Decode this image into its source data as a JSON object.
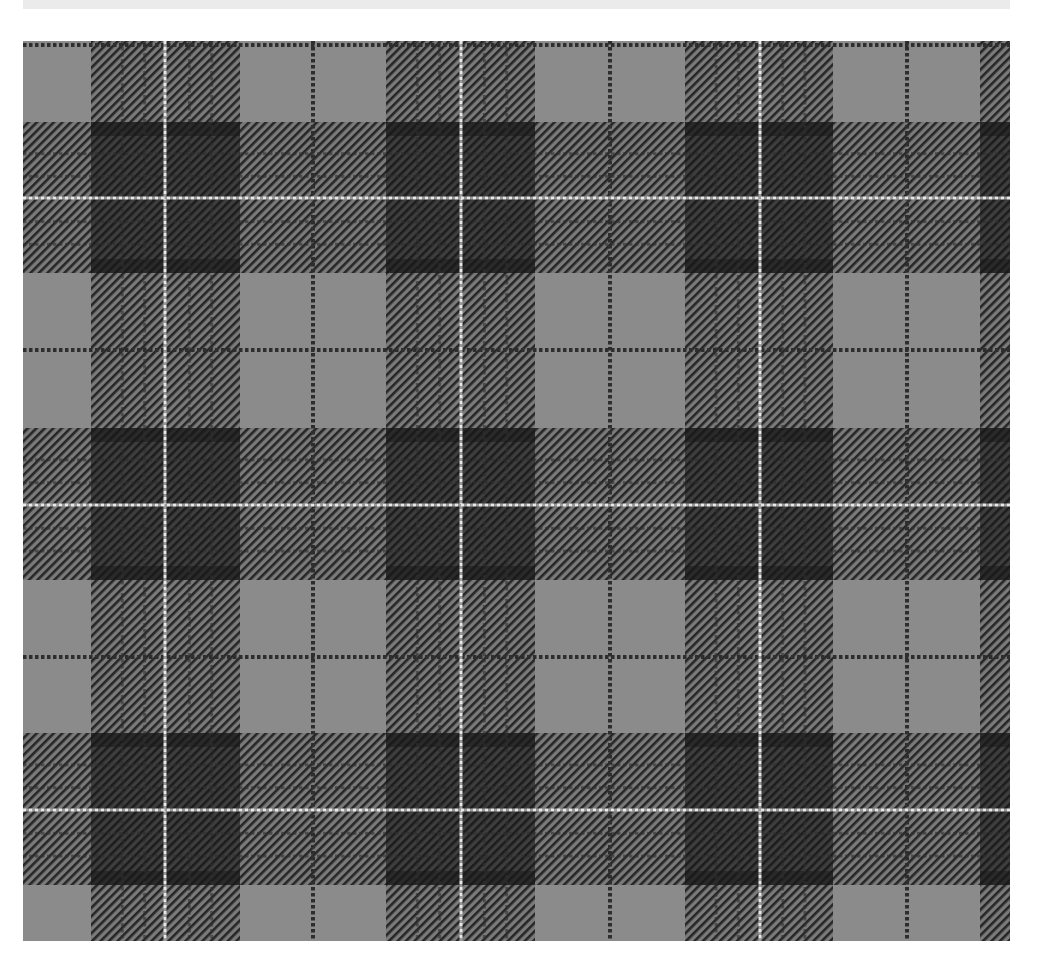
{
  "image": {
    "subject": "tartan-fabric-swatch",
    "description": "Grayscale tartan plaid fabric with dark twill bands, thin dark pinstripes and white overcheck lines",
    "canvas": {
      "width": 1040,
      "height": 973,
      "background": "#ffffff"
    },
    "top_strip": {
      "x": 23,
      "y": 0,
      "width": 987,
      "height": 9,
      "color": "#ebebeb"
    },
    "fabric": {
      "x": 23,
      "y": 41,
      "width": 987,
      "height": 900
    },
    "colors": {
      "ground": "#8b8b8b",
      "twill_dark": "#2c2c2c",
      "band_dark": "#3a3a3a",
      "band_darkest": "#1e1e1e",
      "pinstripe": "#333333",
      "overcheck": "#e6e6e6"
    },
    "sett": {
      "vertical_bands_x": [
        {
          "start": 91,
          "end": 240,
          "white": 165
        },
        {
          "start": 386,
          "end": 535,
          "white": 461
        },
        {
          "start": 685,
          "end": 833,
          "white": 760
        },
        {
          "start": 980,
          "end": 1128,
          "white": 1055
        }
      ],
      "vertical_pinstripes_x": [
        313,
        610,
        907
      ],
      "horizontal_bands_y": [
        {
          "start": 122,
          "end": 273,
          "white": 198
        },
        {
          "start": 428,
          "end": 580,
          "white": 505
        },
        {
          "start": 733,
          "end": 885,
          "white": 810
        }
      ],
      "horizontal_pinstripes_y": [
        45,
        350,
        657
      ]
    }
  }
}
